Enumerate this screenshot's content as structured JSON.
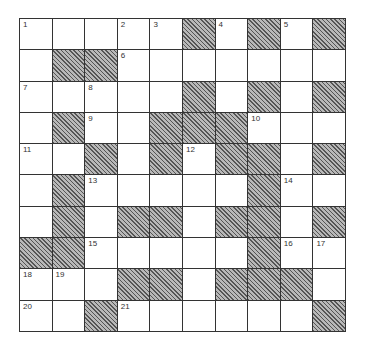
{
  "puzzle": {
    "rows": 10,
    "cols": 10,
    "grid": [
      [
        "W",
        "W",
        "W",
        "W",
        "W",
        "B",
        "W",
        "B",
        "W",
        "B"
      ],
      [
        "W",
        "B",
        "B",
        "W",
        "W",
        "W",
        "W",
        "W",
        "W",
        "W"
      ],
      [
        "W",
        "W",
        "W",
        "W",
        "W",
        "B",
        "W",
        "B",
        "W",
        "B"
      ],
      [
        "W",
        "B",
        "W",
        "W",
        "B",
        "B",
        "B",
        "W",
        "W",
        "W"
      ],
      [
        "W",
        "W",
        "B",
        "W",
        "B",
        "W",
        "B",
        "B",
        "W",
        "B"
      ],
      [
        "W",
        "B",
        "W",
        "W",
        "W",
        "W",
        "W",
        "B",
        "W",
        "W"
      ],
      [
        "W",
        "B",
        "W",
        "B",
        "B",
        "W",
        "B",
        "B",
        "W",
        "B"
      ],
      [
        "B",
        "B",
        "W",
        "W",
        "W",
        "W",
        "W",
        "B",
        "W",
        "W"
      ],
      [
        "W",
        "W",
        "W",
        "B",
        "B",
        "W",
        "B",
        "B",
        "B",
        "W"
      ],
      [
        "W",
        "W",
        "B",
        "W",
        "W",
        "W",
        "W",
        "W",
        "W",
        "B"
      ]
    ],
    "numbers": {
      "0,0": "1",
      "0,3": "2",
      "0,4": "3",
      "0,6": "4",
      "0,8": "5",
      "1,3": "6",
      "2,0": "7",
      "2,2": "8",
      "3,2": "9",
      "3,7": "10",
      "4,0": "11",
      "4,5": "12",
      "5,2": "13",
      "5,8": "14",
      "7,2": "15",
      "7,8": "16",
      "7,9": "17",
      "8,0": "18",
      "8,1": "19",
      "9,0": "20",
      "9,3": "21"
    }
  },
  "colors": {
    "white_cell": "#ffffff",
    "black_cell": "#8a8a8a",
    "grid_line": "#333333"
  }
}
